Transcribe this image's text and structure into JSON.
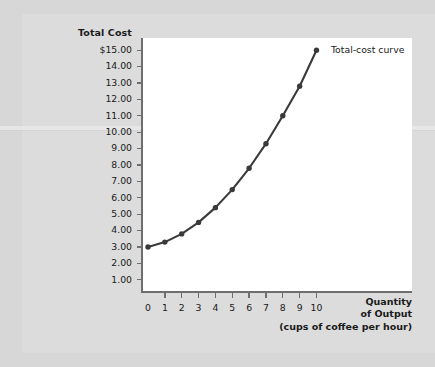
{
  "chart_data": {
    "type": "line",
    "title": "",
    "ylabel": "Total Cost",
    "xlabel": "Quantity of Output (cups of coffee per hour)",
    "xlabel_lines": [
      "Quantity",
      "of Output",
      "(cups of coffee per hour)"
    ],
    "series_label": "Total-cost curve",
    "x": [
      0,
      1,
      2,
      3,
      4,
      5,
      6,
      7,
      8,
      9,
      10
    ],
    "values": [
      3.0,
      3.3,
      3.8,
      4.5,
      5.4,
      6.5,
      7.8,
      9.3,
      11.0,
      12.8,
      15.0
    ],
    "categories": [
      "0",
      "1",
      "2",
      "3",
      "4",
      "5",
      "6",
      "7",
      "8",
      "9",
      "10"
    ],
    "xlim": [
      0,
      10.9
    ],
    "ylim": [
      0,
      15.55
    ],
    "grid": false,
    "legend_position": "inline-right",
    "marker": "filled-circle",
    "line_color": "#3a3a3a",
    "y_ticks": [
      {
        "value": 15,
        "label": "$15.00"
      },
      {
        "value": 14,
        "label": "14.00"
      },
      {
        "value": 13,
        "label": "13.00"
      },
      {
        "value": 12,
        "label": "12.00"
      },
      {
        "value": 11,
        "label": "11.00"
      },
      {
        "value": 10,
        "label": "10.00"
      },
      {
        "value": 9,
        "label": "9.00"
      },
      {
        "value": 8,
        "label": "8.00"
      },
      {
        "value": 7,
        "label": "7.00"
      },
      {
        "value": 6,
        "label": "6.00"
      },
      {
        "value": 5,
        "label": "5.00"
      },
      {
        "value": 4,
        "label": "4.00"
      },
      {
        "value": 3,
        "label": "3.00"
      },
      {
        "value": 2,
        "label": "2.00"
      },
      {
        "value": 1,
        "label": "1.00"
      }
    ],
    "x_ticks": [
      {
        "value": 0,
        "label": "0"
      },
      {
        "value": 1,
        "label": "1"
      },
      {
        "value": 2,
        "label": "2"
      },
      {
        "value": 3,
        "label": "3"
      },
      {
        "value": 4,
        "label": "4"
      },
      {
        "value": 5,
        "label": "5"
      },
      {
        "value": 6,
        "label": "6"
      },
      {
        "value": 7,
        "label": "7"
      },
      {
        "value": 8,
        "label": "8"
      },
      {
        "value": 9,
        "label": "9"
      },
      {
        "value": 10,
        "label": "10"
      }
    ]
  },
  "colors": {
    "page_background": "#d7d7d7",
    "card_background": "#dcdcdc",
    "panel_background": "#ffffff",
    "axis": "#6e6e6e",
    "text": "#1a1a1a",
    "curve": "#3a3a3a"
  }
}
